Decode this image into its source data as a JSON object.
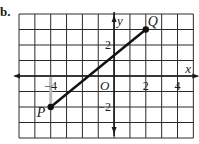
{
  "part_label": "b.",
  "chart_data": {
    "type": "line",
    "title": "",
    "xlabel": "x",
    "ylabel": "y",
    "grid": true,
    "xlim": [
      -6,
      5
    ],
    "ylim": [
      -4,
      4
    ],
    "x_ticks": [
      {
        "value": -4,
        "label": "−4"
      },
      {
        "value": 2,
        "label": "2"
      },
      {
        "value": 4,
        "label": "4"
      }
    ],
    "y_ticks": [
      {
        "value": 2,
        "label": "2"
      },
      {
        "value": -2,
        "label": "−2"
      }
    ],
    "origin_label": "O",
    "points": [
      {
        "name": "P",
        "x": -4,
        "y": -2
      },
      {
        "name": "Q",
        "x": 2,
        "y": 3
      }
    ],
    "segments": [
      {
        "from": "P",
        "to": "Q"
      }
    ],
    "guides": [
      {
        "from": [
          -4,
          0
        ],
        "to": [
          -4,
          -2
        ],
        "color": "#b8b8b8"
      }
    ]
  },
  "colors": {
    "grid": "#2a2a2a",
    "axis": "#1a1a1a",
    "segment": "#111111",
    "point": "#111111",
    "guide": "#b8b8b8"
  }
}
